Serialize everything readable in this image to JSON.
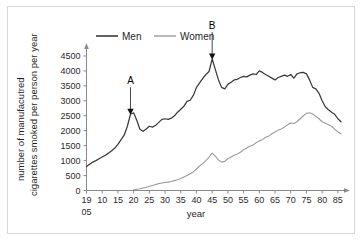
{
  "figure": {
    "frame_color": "#d6d6d6",
    "background": "#ffffff"
  },
  "chart_data": {
    "type": "line",
    "title": "",
    "xlabel": "year",
    "ylabel_line1": "number of manufacutred",
    "ylabel_line2": "cigarettes smoked per person per year",
    "xlim": [
      1905,
      1986
    ],
    "ylim": [
      0,
      4700
    ],
    "grid": false,
    "legend_position": "top-center",
    "x_tick_labels": [
      "19\n05",
      "10",
      "15",
      "20",
      "25",
      "30",
      "35",
      "40",
      "45",
      "50",
      "55",
      "60",
      "65",
      "70",
      "75",
      "80",
      "85"
    ],
    "x_tick_values": [
      1905,
      1910,
      1915,
      1920,
      1925,
      1930,
      1935,
      1940,
      1945,
      1950,
      1955,
      1960,
      1965,
      1970,
      1975,
      1980,
      1985
    ],
    "x_first_tick_top": "19",
    "x_first_tick_bottom": "05",
    "y_tick_labels": [
      "0",
      "500",
      "1000",
      "1500",
      "2000",
      "2500",
      "3000",
      "3500",
      "4000",
      "4500"
    ],
    "y_tick_values": [
      0,
      500,
      1000,
      1500,
      2000,
      2500,
      3000,
      3500,
      4000,
      4500
    ],
    "series": [
      {
        "name": "Men",
        "color": "#3a3a3a",
        "x": [
          1905,
          1906,
          1907,
          1908,
          1909,
          1910,
          1911,
          1912,
          1913,
          1914,
          1915,
          1916,
          1917,
          1918,
          1919,
          1920,
          1921,
          1922,
          1923,
          1924,
          1925,
          1926,
          1927,
          1928,
          1929,
          1930,
          1931,
          1932,
          1933,
          1934,
          1935,
          1936,
          1937,
          1938,
          1939,
          1940,
          1941,
          1942,
          1943,
          1944,
          1945,
          1946,
          1947,
          1948,
          1949,
          1950,
          1951,
          1952,
          1953,
          1954,
          1955,
          1956,
          1957,
          1958,
          1959,
          1960,
          1961,
          1962,
          1963,
          1964,
          1965,
          1966,
          1967,
          1968,
          1969,
          1970,
          1971,
          1972,
          1973,
          1974,
          1975,
          1976,
          1977,
          1978,
          1979,
          1980,
          1981,
          1982,
          1983,
          1984,
          1985,
          1986
        ],
        "values": [
          800,
          880,
          950,
          1000,
          1060,
          1120,
          1180,
          1250,
          1330,
          1420,
          1540,
          1700,
          1850,
          2150,
          2550,
          2600,
          2350,
          2050,
          1980,
          2060,
          2150,
          2120,
          2180,
          2280,
          2380,
          2400,
          2380,
          2420,
          2500,
          2620,
          2720,
          2820,
          2980,
          3020,
          3180,
          3450,
          3600,
          3750,
          3880,
          3980,
          4400,
          4050,
          3700,
          3450,
          3400,
          3550,
          3620,
          3700,
          3720,
          3780,
          3820,
          3800,
          3860,
          3900,
          3880,
          4000,
          3950,
          3880,
          3820,
          3760,
          3700,
          3780,
          3820,
          3860,
          3820,
          3880,
          3760,
          3900,
          3940,
          3950,
          3900,
          3700,
          3450,
          3400,
          3250,
          3000,
          2800,
          2700,
          2620,
          2550,
          2400,
          2300
        ]
      },
      {
        "name": "Women",
        "color": "#9b9b9b",
        "x": [
          1920,
          1921,
          1922,
          1923,
          1924,
          1925,
          1926,
          1927,
          1928,
          1929,
          1930,
          1931,
          1932,
          1933,
          1934,
          1935,
          1936,
          1937,
          1938,
          1939,
          1940,
          1941,
          1942,
          1943,
          1944,
          1945,
          1946,
          1947,
          1948,
          1949,
          1950,
          1951,
          1952,
          1953,
          1954,
          1955,
          1956,
          1957,
          1958,
          1959,
          1960,
          1961,
          1962,
          1963,
          1964,
          1965,
          1966,
          1967,
          1968,
          1969,
          1970,
          1971,
          1972,
          1973,
          1974,
          1975,
          1976,
          1977,
          1978,
          1979,
          1980,
          1981,
          1982,
          1983,
          1984,
          1985,
          1986
        ],
        "values": [
          20,
          40,
          60,
          85,
          110,
          140,
          170,
          200,
          230,
          250,
          270,
          280,
          300,
          330,
          360,
          400,
          450,
          500,
          560,
          620,
          720,
          820,
          900,
          1000,
          1120,
          1250,
          1150,
          1020,
          950,
          980,
          1060,
          1120,
          1180,
          1220,
          1280,
          1360,
          1420,
          1480,
          1520,
          1600,
          1660,
          1700,
          1780,
          1820,
          1900,
          1960,
          2020,
          2060,
          2120,
          2200,
          2260,
          2240,
          2300,
          2400,
          2500,
          2580,
          2600,
          2560,
          2480,
          2400,
          2300,
          2250,
          2200,
          2150,
          2050,
          1960,
          1900
        ]
      }
    ],
    "annotations": [
      {
        "label": "A",
        "x": 1919,
        "y": 2550,
        "note": "arrow pointing down to Men peak"
      },
      {
        "label": "B",
        "x": 1945,
        "y": 4400,
        "note": "arrow pointing down to Men peak"
      }
    ]
  }
}
